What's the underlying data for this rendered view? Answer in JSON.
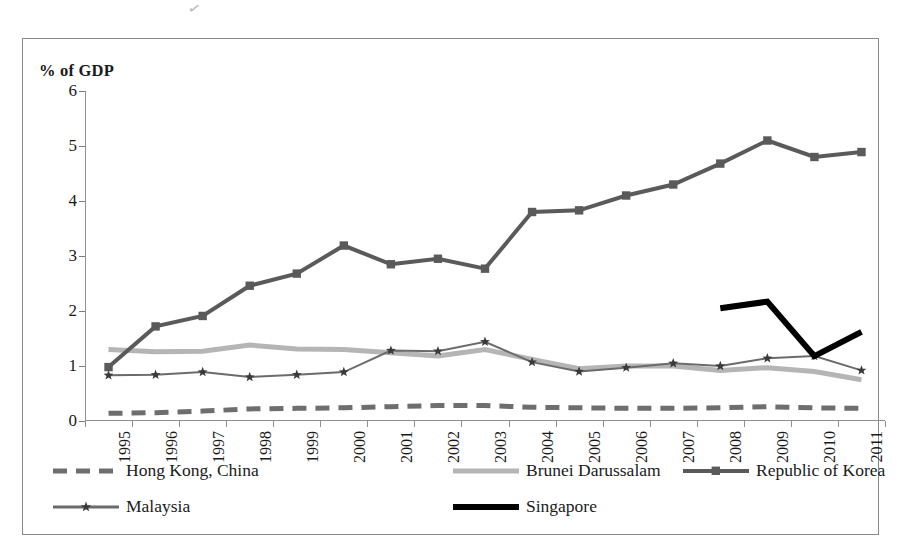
{
  "axis_title": "% of GDP",
  "scan_artifact": "✓",
  "chart_data": {
    "type": "line",
    "title": "",
    "xlabel": "",
    "ylabel": "% of GDP",
    "ylim": [
      0,
      6
    ],
    "y_ticks": [
      0,
      1,
      2,
      3,
      4,
      5,
      6
    ],
    "y_tick_labels": [
      "0",
      "1",
      "2",
      "3",
      "4",
      "5",
      "6"
    ],
    "grid": false,
    "legend_position": "bottom",
    "categories": [
      "1995",
      "1996",
      "1997",
      "1998",
      "1999",
      "2000",
      "2001",
      "2002",
      "2003",
      "2004",
      "2005",
      "2006",
      "2007",
      "2008",
      "2009",
      "2010",
      "2011"
    ],
    "series": [
      {
        "name": "Hong Kong, China",
        "color": "#6e6e6e",
        "style": "dashed",
        "marker": "none",
        "width": 5,
        "values": [
          0.14,
          0.15,
          0.18,
          0.22,
          0.23,
          0.24,
          0.26,
          0.28,
          0.28,
          0.25,
          0.24,
          0.23,
          0.23,
          0.24,
          0.26,
          0.24,
          0.23
        ]
      },
      {
        "name": "Brunei Darussalam",
        "color": "#b5b5b5",
        "style": "solid",
        "marker": "none",
        "width": 5,
        "values": [
          1.3,
          1.26,
          1.27,
          1.38,
          1.31,
          1.3,
          1.24,
          1.18,
          1.3,
          1.12,
          0.95,
          1.0,
          1.0,
          0.92,
          0.97,
          0.9,
          0.75
        ]
      },
      {
        "name": "Republic of Korea",
        "color": "#5a5a5a",
        "style": "solid",
        "marker": "square",
        "width": 4,
        "values": [
          0.98,
          1.72,
          1.91,
          2.46,
          2.68,
          3.19,
          2.85,
          2.95,
          2.77,
          3.8,
          3.83,
          4.1,
          4.3,
          4.68,
          5.1,
          4.8,
          4.89
        ]
      },
      {
        "name": "Malaysia",
        "color": "#6b6b6b",
        "style": "solid",
        "marker": "star",
        "width": 2,
        "values": [
          0.83,
          0.84,
          0.89,
          0.8,
          0.84,
          0.89,
          1.28,
          1.27,
          1.44,
          1.07,
          0.9,
          0.97,
          1.05,
          1.0,
          1.14,
          1.18,
          0.92
        ]
      },
      {
        "name": "Singapore",
        "color": "#000000",
        "style": "solid",
        "marker": "none",
        "width": 6,
        "values": [
          null,
          null,
          null,
          null,
          null,
          null,
          null,
          null,
          null,
          null,
          null,
          null,
          null,
          2.05,
          2.17,
          1.18,
          1.62
        ]
      }
    ]
  },
  "legend": {
    "items": [
      {
        "label": "Hong Kong, China",
        "row": 0,
        "col": 0
      },
      {
        "label": "Brunei Darussalam",
        "row": 0,
        "col": 1
      },
      {
        "label": "Republic of Korea",
        "row": 0,
        "col": 2
      },
      {
        "label": "Malaysia",
        "row": 1,
        "col": 0
      },
      {
        "label": "Singapore",
        "row": 1,
        "col": 1
      }
    ]
  }
}
